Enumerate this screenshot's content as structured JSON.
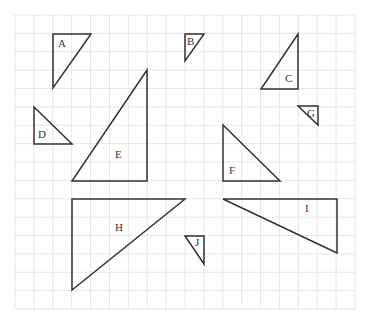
{
  "grid": {
    "x0": 15,
    "y0": 15,
    "x1": 355,
    "y1": 309,
    "cols": 18,
    "rows": 16,
    "line_color": "#e6e6e6"
  },
  "stroke_color": "#333333",
  "triangles": [
    {
      "label": "A",
      "points": [
        [
          53,
          34
        ],
        [
          91,
          34
        ],
        [
          53,
          88
        ]
      ],
      "label_pos": [
        58,
        47
      ]
    },
    {
      "label": "B",
      "points": [
        [
          185,
          34
        ],
        [
          204,
          34
        ],
        [
          185,
          61
        ]
      ],
      "label_pos": [
        187,
        45
      ]
    },
    {
      "label": "C",
      "points": [
        [
          298,
          34
        ],
        [
          298,
          89
        ],
        [
          261,
          89
        ]
      ],
      "label_pos": [
        285,
        82
      ]
    },
    {
      "label": "D",
      "points": [
        [
          34,
          107
        ],
        [
          34,
          144
        ],
        [
          72,
          144
        ]
      ],
      "label_pos": [
        38,
        138
      ]
    },
    {
      "label": "E",
      "points": [
        [
          147,
          70
        ],
        [
          147,
          181
        ],
        [
          72,
          181
        ]
      ],
      "label_pos": [
        115,
        158
      ]
    },
    {
      "label": "F",
      "points": [
        [
          223,
          125
        ],
        [
          223,
          181
        ],
        [
          280,
          181
        ]
      ],
      "label_pos": [
        229,
        174
      ]
    },
    {
      "label": "G",
      "points": [
        [
          298,
          106
        ],
        [
          318,
          106
        ],
        [
          318,
          125
        ]
      ],
      "label_pos": [
        307,
        117
      ]
    },
    {
      "label": "H",
      "points": [
        [
          72,
          199
        ],
        [
          185,
          199
        ],
        [
          72,
          290
        ]
      ],
      "label_pos": [
        115,
        231
      ]
    },
    {
      "label": "I",
      "points": [
        [
          223,
          199
        ],
        [
          337,
          199
        ],
        [
          337,
          253
        ]
      ],
      "label_pos": [
        305,
        212
      ]
    },
    {
      "label": "J",
      "points": [
        [
          185,
          236
        ],
        [
          204,
          236
        ],
        [
          204,
          264
        ]
      ],
      "label_pos": [
        195,
        246
      ]
    }
  ]
}
